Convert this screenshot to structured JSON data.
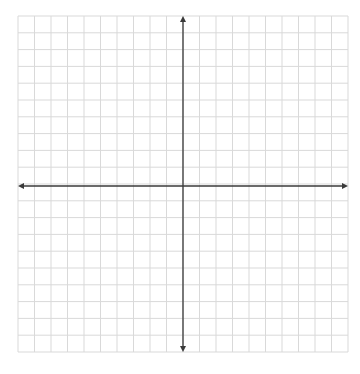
{
  "diagram": {
    "type": "coordinate-plane",
    "title": "",
    "grid": {
      "columns": 20,
      "rows": 20,
      "left": 18,
      "top": 16,
      "right": 348,
      "bottom": 352,
      "line_color": "#d9d9d9"
    },
    "axes": {
      "color": "#3a3a3a",
      "x_axis": {
        "arrows": [
          "left",
          "right"
        ],
        "labels": []
      },
      "y_axis": {
        "arrows": [
          "up",
          "down"
        ],
        "labels": []
      },
      "origin_px": [
        183,
        186
      ]
    },
    "background": "#ffffff"
  }
}
